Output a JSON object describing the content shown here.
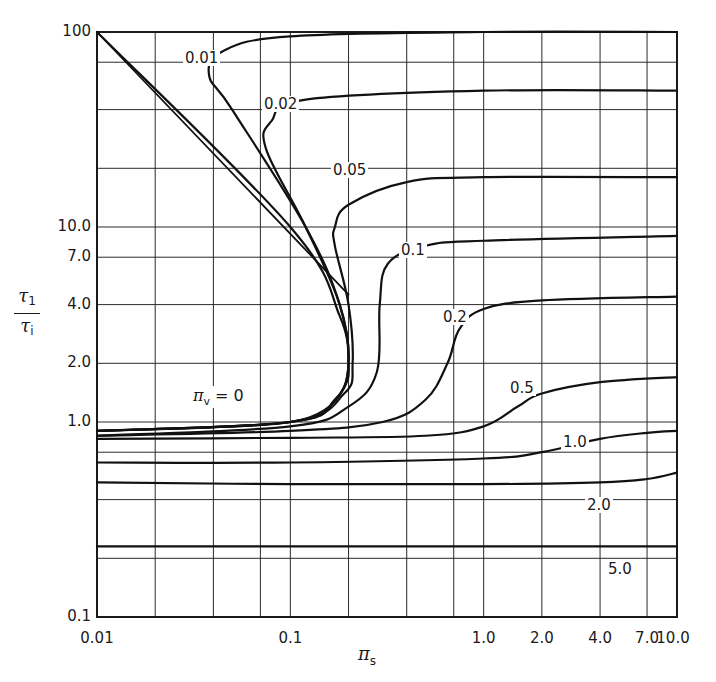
{
  "chart_data": {
    "type": "line",
    "title": "",
    "xlabel": "π_s",
    "ylabel": "τ_1 / τ_i",
    "xscale": "log",
    "yscale": "log",
    "xlim": [
      0.01,
      10.0
    ],
    "ylim": [
      0.1,
      100
    ],
    "grid": true,
    "x_ticks": [
      "0.01",
      "0.1",
      "1.0",
      "2.0",
      "4.0",
      "7.0",
      "10.0"
    ],
    "y_ticks": [
      "100",
      "10.0",
      "7.0",
      "4.0",
      "2.0",
      "1.0",
      "0.1"
    ],
    "x_gridlines": [
      0.01,
      0.02,
      0.04,
      0.07,
      0.1,
      0.2,
      0.4,
      0.7,
      1.0,
      2.0,
      4.0,
      7.0,
      10.0
    ],
    "y_gridlines": [
      0.1,
      0.2,
      0.4,
      0.7,
      1.0,
      2.0,
      4.0,
      7.0,
      10.0,
      20.0,
      40.0,
      70.0,
      100.0
    ],
    "parameter_label": "π_v = 0",
    "legend": "inline curve labels (π_v values)",
    "series": [
      {
        "name": "diagonal",
        "label": "",
        "points": [
          [
            0.01,
            100
          ],
          [
            0.1,
            10
          ],
          [
            0.2,
            4.5
          ]
        ]
      },
      {
        "name": "pi_v=0",
        "label": "π_v = 0",
        "points": [
          [
            0.01,
            0.9
          ],
          [
            0.05,
            0.95
          ],
          [
            0.1,
            1.0
          ],
          [
            0.15,
            1.15
          ],
          [
            0.19,
            1.5
          ],
          [
            0.2,
            2.0
          ],
          [
            0.18,
            3.5
          ],
          [
            0.1,
            10
          ],
          [
            0.01,
            100
          ]
        ]
      },
      {
        "name": "pi_v=0.01",
        "label": "0.01",
        "points": [
          [
            0.01,
            0.9
          ],
          [
            0.1,
            1.0
          ],
          [
            0.17,
            1.3
          ],
          [
            0.2,
            2.0
          ],
          [
            0.18,
            4.0
          ],
          [
            0.12,
            10
          ],
          [
            0.05,
            40
          ],
          [
            0.038,
            60
          ],
          [
            0.045,
            80
          ],
          [
            0.1,
            95
          ],
          [
            1.0,
            100
          ],
          [
            10.0,
            100
          ]
        ]
      },
      {
        "name": "pi_v=0.02",
        "label": "0.02",
        "points": [
          [
            0.01,
            0.9
          ],
          [
            0.1,
            1.0
          ],
          [
            0.17,
            1.3
          ],
          [
            0.2,
            2.0
          ],
          [
            0.18,
            4.0
          ],
          [
            0.12,
            10
          ],
          [
            0.075,
            25
          ],
          [
            0.08,
            35
          ],
          [
            0.12,
            45
          ],
          [
            1.0,
            50
          ],
          [
            10.0,
            50
          ]
        ]
      },
      {
        "name": "pi_v=0.05",
        "label": "0.05",
        "points": [
          [
            0.01,
            0.9
          ],
          [
            0.1,
            1.0
          ],
          [
            0.19,
            1.4
          ],
          [
            0.21,
            2.0
          ],
          [
            0.2,
            4.0
          ],
          [
            0.17,
            8
          ],
          [
            0.17,
            10
          ],
          [
            0.2,
            13
          ],
          [
            0.4,
            17
          ],
          [
            1.0,
            18
          ],
          [
            10.0,
            18
          ]
        ]
      },
      {
        "name": "pi_v=0.1",
        "label": "0.1",
        "points": [
          [
            0.01,
            0.85
          ],
          [
            0.1,
            0.95
          ],
          [
            0.2,
            1.2
          ],
          [
            0.28,
            1.8
          ],
          [
            0.29,
            4.0
          ],
          [
            0.32,
            6.5
          ],
          [
            0.5,
            8
          ],
          [
            1.0,
            8.5
          ],
          [
            10.0,
            9
          ]
        ]
      },
      {
        "name": "pi_v=0.2",
        "label": "0.2",
        "points": [
          [
            0.01,
            0.85
          ],
          [
            0.1,
            0.9
          ],
          [
            0.3,
            1.0
          ],
          [
            0.5,
            1.3
          ],
          [
            0.65,
            2.0
          ],
          [
            0.75,
            3.0
          ],
          [
            1.0,
            3.8
          ],
          [
            2.0,
            4.2
          ],
          [
            10.0,
            4.4
          ]
        ]
      },
      {
        "name": "pi_v=0.5",
        "label": "0.5",
        "points": [
          [
            0.01,
            0.82
          ],
          [
            0.1,
            0.83
          ],
          [
            0.5,
            0.85
          ],
          [
            1.0,
            0.95
          ],
          [
            1.5,
            1.2
          ],
          [
            2.0,
            1.4
          ],
          [
            4.0,
            1.6
          ],
          [
            10.0,
            1.7
          ]
        ]
      },
      {
        "name": "pi_v=1.0",
        "label": "1.0",
        "points": [
          [
            0.01,
            0.62
          ],
          [
            0.1,
            0.62
          ],
          [
            1.0,
            0.65
          ],
          [
            2.0,
            0.7
          ],
          [
            4.0,
            0.82
          ],
          [
            7.0,
            0.88
          ],
          [
            10.0,
            0.9
          ]
        ]
      },
      {
        "name": "pi_v=2.0",
        "label": "2.0",
        "points": [
          [
            0.01,
            0.49
          ],
          [
            0.1,
            0.48
          ],
          [
            1.0,
            0.48
          ],
          [
            4.0,
            0.49
          ],
          [
            7.0,
            0.51
          ],
          [
            10.0,
            0.55
          ]
        ]
      },
      {
        "name": "pi_v=5.0",
        "label": "5.0",
        "points": [
          [
            0.01,
            0.23
          ],
          [
            0.1,
            0.23
          ],
          [
            1.0,
            0.23
          ],
          [
            10.0,
            0.23
          ]
        ]
      }
    ]
  },
  "axes": {
    "x_ticks": [
      {
        "label": "0.01",
        "value": 0.01
      },
      {
        "label": "0.1",
        "value": 0.1
      },
      {
        "label": "1.0",
        "value": 1.0
      },
      {
        "label": "2.0",
        "value": 2.0
      },
      {
        "label": "4.0",
        "value": 4.0
      },
      {
        "label": "7.0",
        "value": 7.0
      },
      {
        "label": "10.0",
        "value": 10.0
      }
    ],
    "y_ticks": [
      {
        "label": "100",
        "value": 100
      },
      {
        "label": "10.0",
        "value": 10
      },
      {
        "label": "7.0",
        "value": 7
      },
      {
        "label": "4.0",
        "value": 4
      },
      {
        "label": "2.0",
        "value": 2
      },
      {
        "label": "1.0",
        "value": 1
      },
      {
        "label": "0.1",
        "value": 0.1
      }
    ],
    "xlabel_main": "π",
    "xlabel_sub": "s",
    "ylabel_num": "τ",
    "ylabel_num_sub": "1",
    "ylabel_den": "τ",
    "ylabel_den_sub": "i"
  },
  "curve_labels": {
    "pv0_pi": "π",
    "pv0_sub": "v",
    "pv0_rest": " = 0",
    "c001": "0.01",
    "c002": "0.02",
    "c005": "0.05",
    "c01": "0.1",
    "c02": "0.2",
    "c05": "0.5",
    "c10": "1.0",
    "c20": "2.0",
    "c50": "5.0"
  },
  "colors": {
    "ink": "#1a1a1a",
    "grid": "#2a2a2a",
    "background": "#ffffff"
  }
}
